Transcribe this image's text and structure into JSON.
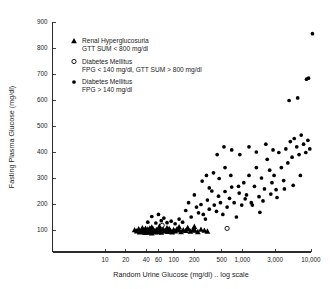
{
  "chart_data": {
    "type": "scatter",
    "title": "",
    "xlabel": "Random Urine Glucose (mg/dl) .. log scale",
    "ylabel": "Fasting Plasma Glucose (mg/dl)",
    "xscale": "log",
    "yscale": "linear",
    "xlim": [
      7,
      14000
    ],
    "ylim": [
      0,
      900
    ],
    "grid": false,
    "legend_position": "upper-left-inside",
    "x_tick_labels": [
      "10",
      "20",
      "40",
      "60",
      "100",
      "200",
      "500",
      "1,000",
      "3,000",
      "10,000"
    ],
    "x_tick_values": [
      10,
      20,
      40,
      60,
      100,
      200,
      500,
      1000,
      3000,
      10000
    ],
    "y_tick_labels": [
      "100",
      "200",
      "300",
      "400",
      "500",
      "600",
      "700",
      "800",
      "900"
    ],
    "y_tick_values": [
      100,
      200,
      300,
      400,
      500,
      600,
      700,
      800,
      900
    ],
    "legend": [
      {
        "marker": "filled-triangle",
        "line1": "Renal Hyperglucosuria",
        "line2": "GTT SUM < 800 mg/dl"
      },
      {
        "marker": "open-circle",
        "line1": "Diabetes Mellitus",
        "line2": "FPG < 140 mg/dl, GTT SUM > 800 mg/dl"
      },
      {
        "marker": "filled-circle",
        "line1": "Diabetes Mellitus",
        "line2": "FPG > 140 mg/dl"
      }
    ],
    "series": [
      {
        "name": "Renal Hyperglucosuria (GTT SUM < 800 mg/dl)",
        "marker": "filled-triangle",
        "points": [
          [
            27,
            100
          ],
          [
            29,
            96
          ],
          [
            31,
            104
          ],
          [
            32,
            92
          ],
          [
            34,
            99
          ],
          [
            35,
            108
          ],
          [
            36,
            94
          ],
          [
            37,
            101
          ],
          [
            38,
            90
          ],
          [
            39,
            106
          ],
          [
            40,
            97
          ],
          [
            41,
            92
          ],
          [
            42,
            103
          ],
          [
            43,
            98
          ],
          [
            44,
            91
          ],
          [
            45,
            107
          ],
          [
            46,
            95
          ],
          [
            47,
            100
          ],
          [
            48,
            88
          ],
          [
            50,
            104
          ],
          [
            52,
            96
          ],
          [
            54,
            92
          ],
          [
            56,
            101
          ],
          [
            58,
            97
          ],
          [
            60,
            93
          ],
          [
            62,
            107
          ],
          [
            64,
            99
          ],
          [
            66,
            91
          ],
          [
            70,
            103
          ],
          [
            74,
            96
          ],
          [
            78,
            100
          ],
          [
            82,
            94
          ],
          [
            86,
            105
          ],
          [
            90,
            98
          ],
          [
            95,
            92
          ],
          [
            100,
            101
          ],
          [
            105,
            96
          ],
          [
            112,
            104
          ],
          [
            120,
            99
          ],
          [
            128,
            93
          ],
          [
            138,
            100
          ],
          [
            150,
            97
          ],
          [
            162,
            103
          ],
          [
            175,
            95
          ],
          [
            190,
            100
          ],
          [
            205,
            98
          ],
          [
            225,
            93
          ],
          [
            250,
            102
          ],
          [
            280,
            98
          ],
          [
            310,
            95
          ],
          [
            48,
            111
          ],
          [
            62,
            114
          ],
          [
            80,
            108
          ],
          [
            120,
            112
          ],
          [
            160,
            109
          ],
          [
            200,
            113
          ]
        ]
      },
      {
        "name": "Diabetes Mellitus (FPG < 140 mg/dl, GTT SUM > 800 mg/dl)",
        "marker": "open-circle",
        "points": [
          [
            68,
            118
          ],
          [
            600,
            106
          ]
        ]
      },
      {
        "name": "Diabetes Mellitus (FPG > 140 mg/dl)",
        "marker": "filled-circle",
        "points": [
          [
            42,
            130
          ],
          [
            48,
            152
          ],
          [
            55,
            127
          ],
          [
            60,
            160
          ],
          [
            66,
            136
          ],
          [
            72,
            146
          ],
          [
            80,
            128
          ],
          [
            92,
            134
          ],
          [
            105,
            124
          ],
          [
            120,
            142
          ],
          [
            135,
            130
          ],
          [
            150,
            175
          ],
          [
            165,
            205
          ],
          [
            180,
            150
          ],
          [
            200,
            235
          ],
          [
            215,
            188
          ],
          [
            230,
            166
          ],
          [
            250,
            198
          ],
          [
            260,
            288
          ],
          [
            270,
            160
          ],
          [
            290,
            142
          ],
          [
            310,
            215
          ],
          [
            330,
            180
          ],
          [
            360,
            250
          ],
          [
            390,
            196
          ],
          [
            420,
            172
          ],
          [
            450,
            230
          ],
          [
            480,
            205
          ],
          [
            520,
            160
          ],
          [
            560,
            248
          ],
          [
            600,
            188
          ],
          [
            650,
            222
          ],
          [
            700,
            265
          ],
          [
            760,
            205
          ],
          [
            820,
            150
          ],
          [
            900,
            242
          ],
          [
            980,
            196
          ],
          [
            1050,
            282
          ],
          [
            1150,
            235
          ],
          [
            1250,
            310
          ],
          [
            1350,
            205
          ],
          [
            1500,
            268
          ],
          [
            1600,
            340
          ],
          [
            1750,
            228
          ],
          [
            1900,
            300
          ],
          [
            2100,
            258
          ],
          [
            2300,
            372
          ],
          [
            2500,
            330
          ],
          [
            2700,
            282
          ],
          [
            2900,
            310
          ],
          [
            3100,
            255
          ],
          [
            3400,
            398
          ],
          [
            3700,
            340
          ],
          [
            4000,
            290
          ],
          [
            4300,
            412
          ],
          [
            4600,
            358
          ],
          [
            5000,
            440
          ],
          [
            5300,
            380
          ],
          [
            5700,
            452
          ],
          [
            6200,
            420
          ],
          [
            6700,
            390
          ],
          [
            7200,
            465
          ],
          [
            7800,
            430
          ],
          [
            8400,
            398
          ],
          [
            9000,
            445
          ],
          [
            9600,
            412
          ],
          [
            4800,
            598
          ],
          [
            6400,
            608
          ],
          [
            8600,
            680
          ],
          [
            9200,
            684
          ],
          [
            10500,
            855
          ],
          [
            2000,
            212
          ],
          [
            2600,
            238
          ],
          [
            3200,
            225
          ],
          [
            4100,
            258
          ],
          [
            5500,
            272
          ],
          [
            7000,
            310
          ],
          [
            1400,
            196
          ],
          [
            1800,
            168
          ],
          [
            880,
            268
          ],
          [
            1100,
            220
          ],
          [
            680,
            310
          ],
          [
            560,
            340
          ],
          [
            460,
            298
          ],
          [
            380,
            320
          ],
          [
            330,
            262
          ],
          [
            300,
            310
          ],
          [
            430,
            390
          ],
          [
            540,
            420
          ],
          [
            700,
            408
          ],
          [
            920,
            390
          ],
          [
            1250,
            420
          ],
          [
            1600,
            400
          ],
          [
            2200,
            430
          ],
          [
            2800,
            408
          ]
        ]
      }
    ]
  }
}
